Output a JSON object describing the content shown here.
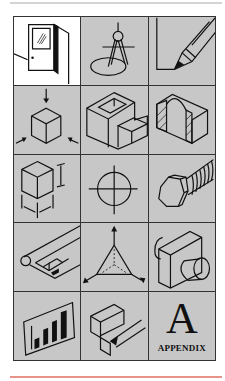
{
  "page": {
    "accent_color": "#e8938a",
    "cell_background": "#c7c7c7",
    "grid_line_color": "#333333"
  },
  "grid": {
    "columns": 3,
    "rows": 5,
    "cells": [
      {
        "icon": "door-icon",
        "label": ""
      },
      {
        "icon": "compass-icon",
        "label": ""
      },
      {
        "icon": "pencil-corner-icon",
        "label": ""
      },
      {
        "icon": "cube-view-arrows-icon",
        "label": ""
      },
      {
        "icon": "hollow-block-icon",
        "label": ""
      },
      {
        "icon": "section-cut-block-icon",
        "label": ""
      },
      {
        "icon": "dimensioned-cube-icon",
        "label": ""
      },
      {
        "icon": "centerline-circle-icon",
        "label": ""
      },
      {
        "icon": "hex-bolt-icon",
        "label": ""
      },
      {
        "icon": "blueprint-scroll-icon",
        "label": ""
      },
      {
        "icon": "isometric-axes-icon",
        "label": ""
      },
      {
        "icon": "cylinder-block-icon",
        "label": ""
      },
      {
        "icon": "bar-chart-icon",
        "label": ""
      },
      {
        "icon": "sketching-block-icon",
        "label": ""
      },
      {
        "icon": "appendix-icon",
        "label": "APPENDIX",
        "letter": "A"
      }
    ]
  }
}
